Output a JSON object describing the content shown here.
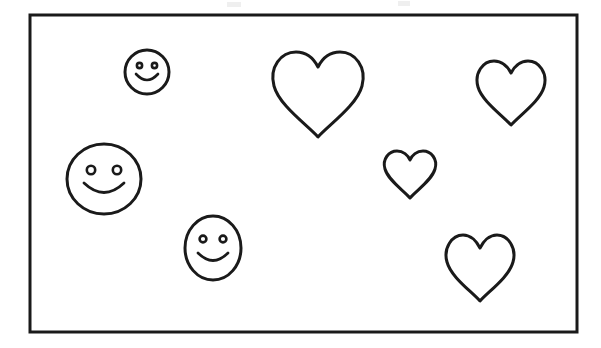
{
  "canvas": {
    "width": 601,
    "height": 348,
    "background_color": "#ffffff",
    "description": "Black-and-white line drawing worksheet: a rectangular frame containing scattered outline smiley faces and outline hearts"
  },
  "frame": {
    "name": "border-rectangle",
    "x": 30,
    "y": 15,
    "width": 547,
    "height": 317,
    "stroke_color": "#1a1a1a",
    "stroke_width": 3,
    "fill_color": "#ffffff"
  },
  "style": {
    "stroke_color": "#1a1a1a",
    "fill_color": "#ffffff",
    "shape_stroke_width": 3,
    "detail_stroke_width": 2.4
  },
  "counts": {
    "smileys": 3,
    "hearts": 4,
    "total_shapes": 7
  },
  "shapes": [
    {
      "id": "smiley-small-top-left",
      "type": "smiley",
      "label": "Small smiley face",
      "cx": 147,
      "cy": 72,
      "rx": 22,
      "ry": 22,
      "eye_dx": 7.5,
      "eye_dy": -6.5,
      "eye_r": 2.6,
      "mouth_rx": 11,
      "mouth_ry": 8,
      "mouth_y": 74
    },
    {
      "id": "smiley-large-left",
      "type": "smiley",
      "label": "Large smiley face",
      "cx": 104,
      "cy": 179,
      "rx": 37,
      "ry": 35,
      "eye_dx": 13,
      "eye_dy": -9,
      "eye_r": 4.2,
      "mouth_rx": 20,
      "mouth_ry": 13,
      "mouth_y": 183
    },
    {
      "id": "smiley-medium-bottom-center",
      "type": "smiley",
      "label": "Medium smiley face",
      "cx": 213,
      "cy": 248,
      "rx": 28,
      "ry": 32,
      "eye_dx": 10,
      "eye_dy": -9,
      "eye_r": 3.4,
      "mouth_rx": 15,
      "mouth_ry": 10,
      "mouth_y": 253
    },
    {
      "id": "heart-large-top-center",
      "type": "heart",
      "label": "Large heart",
      "cx": 318,
      "cy": 95,
      "width": 94,
      "height": 86
    },
    {
      "id": "heart-medium-top-right",
      "type": "heart",
      "label": "Medium heart top right",
      "cx": 511,
      "cy": 93,
      "width": 69,
      "height": 65
    },
    {
      "id": "heart-small-center",
      "type": "heart",
      "label": "Small heart",
      "cx": 410,
      "cy": 175,
      "width": 51,
      "height": 47
    },
    {
      "id": "heart-medium-bottom-right",
      "type": "heart",
      "label": "Medium heart bottom right",
      "cx": 480,
      "cy": 268,
      "width": 69,
      "height": 66
    }
  ],
  "artifacts": [
    {
      "id": "scan-speck-left",
      "x": 227,
      "y": 2,
      "width": 14,
      "height": 5
    },
    {
      "id": "scan-speck-right",
      "x": 398,
      "y": 1,
      "width": 12,
      "height": 5
    }
  ]
}
